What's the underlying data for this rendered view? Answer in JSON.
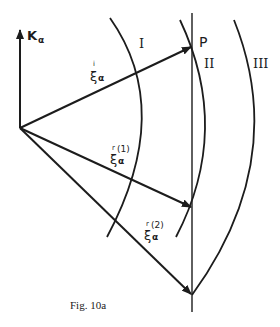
{
  "figure": {
    "caption": "Fig. 10a",
    "axis": {
      "label_main": "K",
      "label_sub": "α"
    },
    "point_label": "P",
    "regions": [
      "I",
      "II",
      "III"
    ],
    "vectors": [
      {
        "symbol": "ξ",
        "sub": "α",
        "sup": "i",
        "name": "incident"
      },
      {
        "symbol": "ξ",
        "sub": "α",
        "sup": "r",
        "sup2": "(1)",
        "name": "reflected-1"
      },
      {
        "symbol": "ξ",
        "sub": "α",
        "sup": "r",
        "sup2": "(2)",
        "name": "reflected-2"
      }
    ],
    "colors": {
      "ink": "#1c1c1c",
      "background": "#ffffff"
    }
  }
}
